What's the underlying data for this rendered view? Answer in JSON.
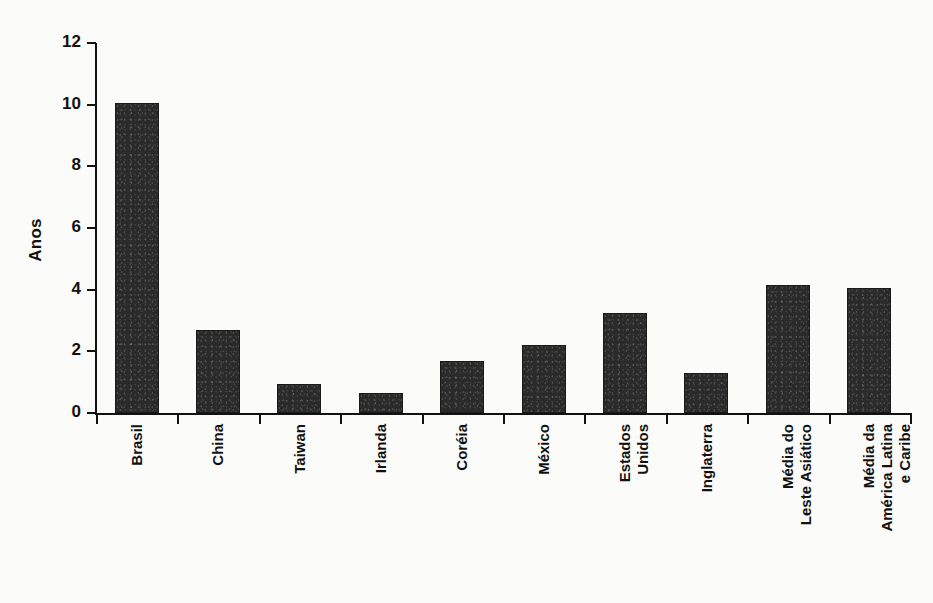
{
  "chart_data": {
    "type": "bar",
    "title": "",
    "xlabel": "",
    "ylabel": "Anos",
    "ylim": [
      0,
      12
    ],
    "ytick_labels": [
      "12",
      "10",
      "8",
      "6",
      "4",
      "2",
      "0"
    ],
    "ytick_values": [
      12,
      10,
      8,
      6,
      4,
      2,
      0
    ],
    "grid": false,
    "legend": null,
    "bar_color": "#2a2a2a",
    "background_color": "#fbfbf9",
    "categories": [
      "Brasil",
      "China",
      "Taiwan",
      "Irlanda",
      "Coréia",
      "México",
      "Estados\nUnidos",
      "Inglaterra",
      "Média do\nLeste Asiático",
      "Média da\nAmérica Latina\ne Caribe"
    ],
    "values": [
      10.05,
      2.7,
      0.95,
      0.65,
      1.7,
      2.2,
      3.25,
      1.3,
      4.15,
      4.05
    ],
    "series": [
      {
        "name": "Anos",
        "values": [
          10.05,
          2.7,
          0.95,
          0.65,
          1.7,
          2.2,
          3.25,
          1.3,
          4.15,
          4.05
        ]
      }
    ]
  }
}
